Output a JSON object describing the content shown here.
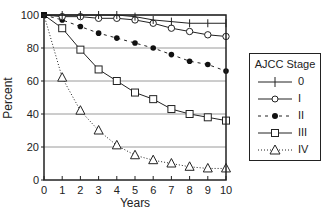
{
  "chart_data": {
    "type": "line",
    "title": "",
    "xlabel": "Years",
    "ylabel": "Percent",
    "x": [
      0,
      1,
      2,
      3,
      4,
      5,
      6,
      7,
      8,
      9,
      10
    ],
    "xlim": [
      0,
      10
    ],
    "ylim": [
      0,
      100
    ],
    "x_ticks": [
      "0",
      "1",
      "2",
      "3",
      "4",
      "5",
      "6",
      "7",
      "8",
      "9",
      "10"
    ],
    "y_ticks": [
      "0",
      "20",
      "40",
      "60",
      "80",
      "100"
    ],
    "grid": "horizontal",
    "legend_title": "AJCC Stage",
    "legend_position": "right",
    "series": [
      {
        "name": "0",
        "marker": "plus",
        "line": "solid",
        "values": [
          100,
          100,
          100,
          100,
          100,
          99,
          97,
          96,
          95,
          95,
          95
        ]
      },
      {
        "name": "I",
        "marker": "open-circle",
        "line": "solid",
        "values": [
          100,
          99,
          99,
          98,
          98,
          97,
          95,
          92,
          90,
          88,
          87
        ]
      },
      {
        "name": "II",
        "marker": "filled-circle",
        "line": "dashed",
        "values": [
          100,
          97,
          93,
          89,
          86,
          83,
          80,
          76,
          72,
          70,
          66
        ]
      },
      {
        "name": "III",
        "marker": "open-square",
        "line": "solid",
        "values": [
          100,
          92,
          79,
          67,
          60,
          53,
          49,
          43,
          40,
          38,
          36
        ]
      },
      {
        "name": "IV",
        "marker": "open-triangle",
        "line": "dotted",
        "values": [
          100,
          62,
          42,
          30,
          21,
          15,
          12,
          10,
          8,
          7,
          7
        ]
      }
    ]
  },
  "legend": {
    "title": "AJCC Stage",
    "items": [
      {
        "label": "0"
      },
      {
        "label": "I"
      },
      {
        "label": "II"
      },
      {
        "label": "III"
      },
      {
        "label": "IV"
      }
    ]
  }
}
